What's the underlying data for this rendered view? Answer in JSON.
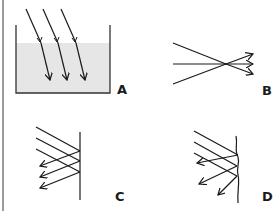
{
  "panels": [
    {
      "id": "A",
      "label": "A",
      "description": "Parallel rays refracting into water in a container"
    },
    {
      "id": "B",
      "label": "B",
      "description": "Rays converging through a focal point and diverging"
    },
    {
      "id": "C",
      "label": "C",
      "description": "Parallel rays reflecting off a flat mirror (regular reflection)"
    },
    {
      "id": "D",
      "label": "D",
      "description": "Parallel rays reflecting off an uneven surface (diffuse reflection)"
    }
  ],
  "colors": {
    "line": "#1a1a1a",
    "water": "#e6e6e6",
    "border": "#9a9a9a"
  }
}
